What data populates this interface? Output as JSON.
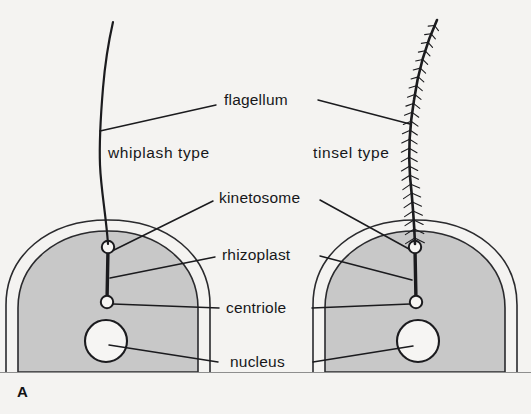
{
  "figure": {
    "panel_letter": "A",
    "background_color": "#f4f3f1",
    "ink_color": "#1b1b1e",
    "cytoplasm_color": "#c8c8c8",
    "organelle_fill": "#f6f5f3"
  },
  "labels": {
    "flagellum": "flagellum",
    "whiplash_type": "whiplash type",
    "tinsel_type": "tinsel type",
    "kinetosome": "kinetosome",
    "rhizoplast": "rhizoplast",
    "centriole": "centriole",
    "nucleus": "nucleus"
  },
  "cells": [
    {
      "id": "left-cell",
      "flagellum_type": "whiplash type",
      "flagellum_description": "smooth whip-like shaft without lateral hairs",
      "organelles": [
        "kinetosome",
        "rhizoplast",
        "centriole",
        "nucleus"
      ]
    },
    {
      "id": "right-cell",
      "flagellum_type": "tinsel type",
      "flagellum_description": "shaft bearing rows of lateral mastigoneme hairs",
      "organelles": [
        "kinetosome",
        "rhizoplast",
        "centriole",
        "nucleus"
      ]
    }
  ],
  "legend_order": [
    "flagellum",
    "kinetosome",
    "rhizoplast",
    "centriole",
    "nucleus"
  ]
}
